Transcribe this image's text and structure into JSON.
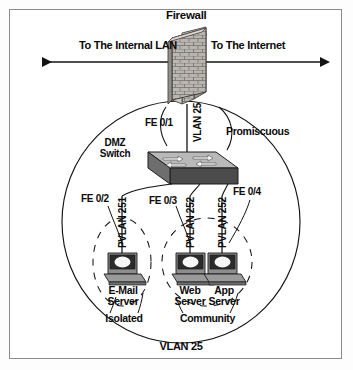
{
  "diagram": {
    "title": "Firewall",
    "outer_zone_label": "VLAN 25",
    "flows": {
      "left": "To The Internal LAN",
      "right": "To The Internet"
    },
    "firewall": {
      "name": "firewall-brick-wall",
      "label": "Firewall"
    },
    "uplink": {
      "port_label": "FE 0/1",
      "vlan_label": "VLAN 25",
      "mode_label": "Promiscuous"
    },
    "switch": {
      "label_line1": "DMZ",
      "label_line2": "Switch",
      "icon": "switch-icon"
    },
    "downlinks": [
      {
        "port_label": "FE 0/2",
        "pvlan_label": "PVLAN 251",
        "server_line1": "E-Mail",
        "server_line2": "Server",
        "icon": "server-computer-icon"
      },
      {
        "port_label": "FE 0/3",
        "pvlan_label": "PVLAN 252",
        "server_line1": "Web",
        "server_line2": "Server",
        "icon": "server-computer-icon"
      },
      {
        "port_label": "FE 0/4",
        "pvlan_label": "PVLAN 252",
        "server_line1": "App",
        "server_line2": "Server",
        "icon": "server-computer-icon"
      }
    ],
    "zones": {
      "isolated": "Isolated",
      "community": "Community"
    },
    "colors": {
      "ink": "#0a0a0a",
      "line": "#1a1a1a",
      "frame": "#8c8c8c",
      "brick_face": "#b8b4b0",
      "brick_side": "#8a8680",
      "switch_top": "#b9b9b9",
      "switch_front": "#4a4a4a",
      "switch_side": "#6e6e6e",
      "screen": "#2b2b2b",
      "page": "#ffffff"
    }
  }
}
